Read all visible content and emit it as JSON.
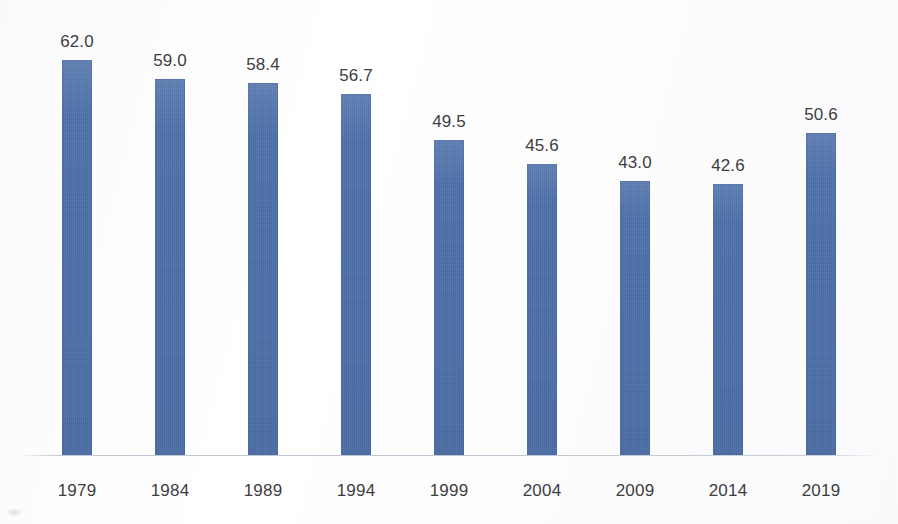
{
  "chart_data": {
    "type": "bar",
    "title": "",
    "subtitle": "",
    "xlabel": "",
    "ylabel": "",
    "categories": [
      "1979",
      "1984",
      "1989",
      "1994",
      "1999",
      "2004",
      "2009",
      "2014",
      "2019"
    ],
    "values": [
      62.0,
      59.0,
      58.4,
      56.7,
      49.5,
      45.6,
      43.0,
      42.6,
      50.6
    ],
    "value_labels": [
      "62.0",
      "59.0",
      "58.4",
      "56.7",
      "49.5",
      "45.6",
      "43.0",
      "42.6",
      "50.6"
    ],
    "ylim": [
      0,
      62.0
    ],
    "grid": false,
    "legend": false,
    "legend_position": "none",
    "y_axis_visible": false,
    "x_axis_visible": true,
    "data_labels_shown": true,
    "series": [
      {
        "name": "",
        "values": [
          62.0,
          59.0,
          58.4,
          56.7,
          49.5,
          45.6,
          43.0,
          42.6,
          50.6
        ]
      }
    ]
  },
  "style": {
    "bar_color": "#4a6ea9",
    "label_color": "#3d3d3f",
    "axis_color": "#bac0cd",
    "background_color": "#fdfdfd"
  }
}
